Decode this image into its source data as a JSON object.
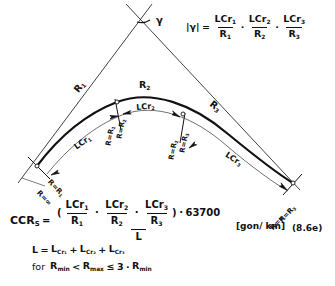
{
  "figure": {
    "equation_number": "(8.6e)",
    "unit": "[gon/ km]"
  },
  "top_formula": {
    "lhs": "|γ|",
    "equals": "=",
    "plus": "·",
    "terms": [
      {
        "num": "LCr",
        "num_sub": "1",
        "den": "R",
        "den_sub": "1"
      },
      {
        "num": "LCr",
        "num_sub": "2",
        "den": "R",
        "den_sub": "2"
      },
      {
        "num": "LCr",
        "num_sub": "3",
        "den": "R",
        "den_sub": "3"
      }
    ]
  },
  "ccrs_formula": {
    "lhs": "CCR",
    "lhs_sub": "S",
    "equals": "=",
    "open_paren": "(",
    "close_paren": ")",
    "plus": "·",
    "multiply": "·",
    "constant": "63700",
    "denominator": "L",
    "terms": [
      {
        "num": "LCr",
        "num_sub": "1",
        "den": "R",
        "den_sub": "1"
      },
      {
        "num": "LCr",
        "num_sub": "2",
        "den": "R",
        "den_sub": "2"
      },
      {
        "num": "LCr",
        "num_sub": "3",
        "den": "R",
        "den_sub": "3"
      }
    ]
  },
  "length_sum": {
    "lhs": "L",
    "equals": "=",
    "plus": "+",
    "terms": [
      {
        "base": "L",
        "sub": "Cr₁"
      },
      {
        "base": "L",
        "sub": "Cr₂"
      },
      {
        "base": "L",
        "sub": "Cr₃"
      }
    ]
  },
  "condition": {
    "prefix": "for",
    "rmin": "R",
    "rmin_sub": "min",
    "lt": "<",
    "rmax": "R",
    "rmax_sub": "max",
    "le": "≤",
    "factor": "3",
    "multiply": "·",
    "rmin2": "R",
    "rmin2_sub": "min"
  },
  "diagram": {
    "angle_label": "γ",
    "radius_labels": [
      {
        "name": "R1",
        "base": "R",
        "sub": "1"
      },
      {
        "name": "R2",
        "base": "R",
        "sub": "2"
      },
      {
        "name": "R3",
        "base": "R",
        "sub": "3"
      }
    ],
    "arc_length_labels": [
      {
        "name": "LCr1",
        "base": "LCr",
        "sub": "1"
      },
      {
        "name": "LCr2",
        "base": "LCr",
        "sub": "2"
      },
      {
        "name": "LCr3",
        "base": "LCr",
        "sub": "3"
      }
    ],
    "station_labels": [
      {
        "name": "start-outer",
        "text": "R=∞"
      },
      {
        "name": "start-inner",
        "text": "R=R",
        "sub": "1"
      },
      {
        "name": "t1-lower",
        "text": "R=R",
        "sub": "1"
      },
      {
        "name": "t1-upper",
        "text": "R=R",
        "sub": "2"
      },
      {
        "name": "t2-lower",
        "text": "R=R",
        "sub": "2"
      },
      {
        "name": "t2-upper",
        "text": "R=R",
        "sub": "3"
      },
      {
        "name": "end-inner",
        "text": "R=R",
        "sub": "3"
      },
      {
        "name": "end-outer",
        "text": "R=∞"
      }
    ]
  }
}
